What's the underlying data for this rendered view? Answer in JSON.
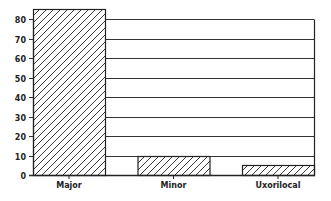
{
  "chart_data": {
    "type": "bar",
    "title": "",
    "xlabel": "",
    "ylabel": "",
    "categories": [
      "Major",
      "Minor",
      "Uxorilocal"
    ],
    "values": [
      85,
      10,
      5
    ],
    "ylim": [
      0,
      80
    ],
    "yticks": [
      0,
      10,
      20,
      30,
      40,
      50,
      60,
      70,
      80
    ],
    "grid": true,
    "legend": null,
    "bar_pattern": "diagonal-hatch",
    "colors": {
      "bar_fill": "#ffffff",
      "hatch": "#222222",
      "grid": "#333333",
      "text": "#222222"
    }
  }
}
